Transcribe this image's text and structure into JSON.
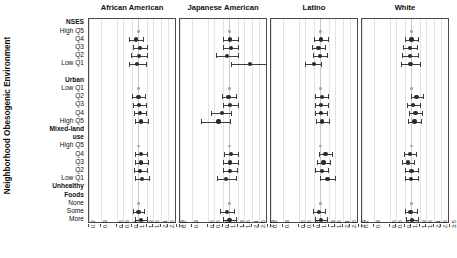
{
  "axis_title": "Neighborhood Obesogenic Environment",
  "chart_data": {
    "type": "scatter",
    "title": "",
    "xlabel": "",
    "ylabel": "Neighborhood Obesogenic Environment",
    "scale": "log",
    "xlim": [
      0.2,
      3.5
    ],
    "grid": true,
    "reference_value": 1.0,
    "legend_position": "none",
    "xticks": [
      "0.2",
      "0.3",
      "0.5",
      "0.6",
      "0.8",
      "1.0",
      "1.3",
      "1.6",
      "2.1",
      "2.6",
      "3.5"
    ],
    "xtick_values": [
      0.2,
      0.3,
      0.5,
      0.6,
      0.8,
      1.0,
      1.3,
      1.6,
      2.1,
      2.6,
      3.5
    ],
    "row_labels": [
      {
        "label": "NSES",
        "bold": true,
        "header": true
      },
      {
        "label": "High Q5",
        "bold": false,
        "header": false
      },
      {
        "label": "Q4",
        "bold": false,
        "header": false
      },
      {
        "label": "Q3",
        "bold": false,
        "header": false
      },
      {
        "label": "Q2",
        "bold": false,
        "header": false
      },
      {
        "label": "Low Q1",
        "bold": false,
        "header": false
      },
      {
        "label": "",
        "bold": false,
        "header": false
      },
      {
        "label": "Urban",
        "bold": true,
        "header": true
      },
      {
        "label": "Low Q1",
        "bold": false,
        "header": false
      },
      {
        "label": "Q2",
        "bold": false,
        "header": false
      },
      {
        "label": "Q3",
        "bold": false,
        "header": false
      },
      {
        "label": "Q4",
        "bold": false,
        "header": false
      },
      {
        "label": "High Q5",
        "bold": false,
        "header": false
      },
      {
        "label": "Mixed-land",
        "bold": true,
        "header": true
      },
      {
        "label": "use",
        "bold": true,
        "header": true
      },
      {
        "label": "High Q5",
        "bold": false,
        "header": false
      },
      {
        "label": "Q4",
        "bold": false,
        "header": false
      },
      {
        "label": "Q3",
        "bold": false,
        "header": false
      },
      {
        "label": "Q2",
        "bold": false,
        "header": false
      },
      {
        "label": "Low Q1",
        "bold": false,
        "header": false
      },
      {
        "label": "Unhealthy",
        "bold": true,
        "header": true
      },
      {
        "label": "Foods",
        "bold": true,
        "header": true
      },
      {
        "label": "None",
        "bold": false,
        "header": false
      },
      {
        "label": "Some",
        "bold": false,
        "header": false
      },
      {
        "label": "More",
        "bold": false,
        "header": false
      }
    ],
    "panels": [
      {
        "name": "African American",
        "points": [
          {
            "row": 1,
            "est": 1.0,
            "lo": 1.0,
            "hi": 1.0,
            "ref": true
          },
          {
            "row": 2,
            "est": 0.93,
            "lo": 0.74,
            "hi": 1.17,
            "ref": false
          },
          {
            "row": 3,
            "est": 1.06,
            "lo": 0.84,
            "hi": 1.33,
            "ref": false
          },
          {
            "row": 4,
            "est": 1.02,
            "lo": 0.79,
            "hi": 1.31,
            "ref": false
          },
          {
            "row": 5,
            "est": 0.96,
            "lo": 0.73,
            "hi": 1.26,
            "ref": false
          },
          {
            "row": 8,
            "est": 1.0,
            "lo": 1.0,
            "hi": 1.0,
            "ref": true
          },
          {
            "row": 9,
            "est": 1.0,
            "lo": 0.82,
            "hi": 1.22,
            "ref": false
          },
          {
            "row": 10,
            "est": 1.03,
            "lo": 0.84,
            "hi": 1.26,
            "ref": false
          },
          {
            "row": 11,
            "est": 1.05,
            "lo": 0.86,
            "hi": 1.29,
            "ref": false
          },
          {
            "row": 12,
            "est": 1.09,
            "lo": 0.88,
            "hi": 1.35,
            "ref": false
          },
          {
            "row": 15,
            "est": 1.0,
            "lo": 1.0,
            "hi": 1.0,
            "ref": true
          },
          {
            "row": 16,
            "est": 1.08,
            "lo": 0.88,
            "hi": 1.33,
            "ref": false
          },
          {
            "row": 17,
            "est": 1.09,
            "lo": 0.88,
            "hi": 1.35,
            "ref": false
          },
          {
            "row": 18,
            "est": 1.06,
            "lo": 0.87,
            "hi": 1.3,
            "ref": false
          },
          {
            "row": 19,
            "est": 1.12,
            "lo": 0.9,
            "hi": 1.39,
            "ref": false
          },
          {
            "row": 22,
            "est": 1.0,
            "lo": 1.0,
            "hi": 1.0,
            "ref": true
          },
          {
            "row": 23,
            "est": 1.0,
            "lo": 0.83,
            "hi": 1.21,
            "ref": false
          },
          {
            "row": 24,
            "est": 1.08,
            "lo": 0.88,
            "hi": 1.32,
            "ref": false
          }
        ]
      },
      {
        "name": "Japanese American",
        "points": [
          {
            "row": 1,
            "est": 1.0,
            "lo": 1.0,
            "hi": 1.0,
            "ref": true
          },
          {
            "row": 2,
            "est": 1.02,
            "lo": 0.8,
            "hi": 1.3,
            "ref": false
          },
          {
            "row": 3,
            "est": 1.04,
            "lo": 0.82,
            "hi": 1.33,
            "ref": false
          },
          {
            "row": 4,
            "est": 0.92,
            "lo": 0.65,
            "hi": 1.3,
            "ref": false
          },
          {
            "row": 5,
            "est": 1.95,
            "lo": 1.05,
            "hi": 3.5,
            "ref": false
          },
          {
            "row": 8,
            "est": 1.0,
            "lo": 1.0,
            "hi": 1.0,
            "ref": true
          },
          {
            "row": 9,
            "est": 0.97,
            "lo": 0.78,
            "hi": 1.22,
            "ref": false
          },
          {
            "row": 10,
            "est": 1.03,
            "lo": 0.82,
            "hi": 1.3,
            "ref": false
          },
          {
            "row": 11,
            "est": 0.78,
            "lo": 0.55,
            "hi": 1.06,
            "ref": false
          },
          {
            "row": 12,
            "est": 0.7,
            "lo": 0.4,
            "hi": 1.02,
            "ref": false
          },
          {
            "row": 15,
            "est": 1.0,
            "lo": 1.0,
            "hi": 1.0,
            "ref": true
          },
          {
            "row": 16,
            "est": 1.05,
            "lo": 0.85,
            "hi": 1.3,
            "ref": false
          },
          {
            "row": 17,
            "est": 1.03,
            "lo": 0.82,
            "hi": 1.3,
            "ref": false
          },
          {
            "row": 18,
            "est": 1.02,
            "lo": 0.8,
            "hi": 1.28,
            "ref": false
          },
          {
            "row": 19,
            "est": 0.9,
            "lo": 0.66,
            "hi": 1.22,
            "ref": false
          },
          {
            "row": 22,
            "est": 1.0,
            "lo": 1.0,
            "hi": 1.0,
            "ref": true
          },
          {
            "row": 23,
            "est": 0.92,
            "lo": 0.73,
            "hi": 1.14,
            "ref": false
          },
          {
            "row": 24,
            "est": 1.0,
            "lo": 0.8,
            "hi": 1.25,
            "ref": false
          }
        ]
      },
      {
        "name": "Latino",
        "points": [
          {
            "row": 1,
            "est": 1.0,
            "lo": 1.0,
            "hi": 1.0,
            "ref": true
          },
          {
            "row": 2,
            "est": 1.02,
            "lo": 0.82,
            "hi": 1.27,
            "ref": false
          },
          {
            "row": 3,
            "est": 0.94,
            "lo": 0.76,
            "hi": 1.17,
            "ref": false
          },
          {
            "row": 4,
            "est": 0.98,
            "lo": 0.79,
            "hi": 1.22,
            "ref": false
          },
          {
            "row": 5,
            "est": 0.8,
            "lo": 0.6,
            "hi": 1.03,
            "ref": false
          },
          {
            "row": 8,
            "est": 1.0,
            "lo": 1.0,
            "hi": 1.0,
            "ref": true
          },
          {
            "row": 9,
            "est": 1.04,
            "lo": 0.85,
            "hi": 1.27,
            "ref": false
          },
          {
            "row": 10,
            "est": 1.03,
            "lo": 0.84,
            "hi": 1.26,
            "ref": false
          },
          {
            "row": 11,
            "est": 1.02,
            "lo": 0.84,
            "hi": 1.25,
            "ref": false
          },
          {
            "row": 12,
            "est": 1.06,
            "lo": 0.86,
            "hi": 1.3,
            "ref": false
          },
          {
            "row": 15,
            "est": 1.0,
            "lo": 1.0,
            "hi": 1.0,
            "ref": true
          },
          {
            "row": 16,
            "est": 1.18,
            "lo": 0.96,
            "hi": 1.45,
            "ref": false
          },
          {
            "row": 17,
            "est": 1.1,
            "lo": 0.9,
            "hi": 1.36,
            "ref": false
          },
          {
            "row": 18,
            "est": 1.04,
            "lo": 0.85,
            "hi": 1.28,
            "ref": false
          },
          {
            "row": 19,
            "est": 1.26,
            "lo": 1.0,
            "hi": 1.58,
            "ref": false
          },
          {
            "row": 22,
            "est": 1.0,
            "lo": 1.0,
            "hi": 1.0,
            "ref": true
          },
          {
            "row": 23,
            "est": 0.96,
            "lo": 0.79,
            "hi": 1.17,
            "ref": false
          },
          {
            "row": 24,
            "est": 1.01,
            "lo": 0.83,
            "hi": 1.24,
            "ref": false
          }
        ]
      },
      {
        "name": "White",
        "points": [
          {
            "row": 1,
            "est": 1.0,
            "lo": 1.0,
            "hi": 1.0,
            "ref": true
          },
          {
            "row": 2,
            "est": 1.0,
            "lo": 0.82,
            "hi": 1.22,
            "ref": false
          },
          {
            "row": 3,
            "est": 0.95,
            "lo": 0.75,
            "hi": 1.2,
            "ref": false
          },
          {
            "row": 4,
            "est": 0.95,
            "lo": 0.73,
            "hi": 1.24,
            "ref": false
          },
          {
            "row": 5,
            "est": 0.97,
            "lo": 0.72,
            "hi": 1.3,
            "ref": false
          },
          {
            "row": 8,
            "est": 1.0,
            "lo": 1.0,
            "hi": 1.0,
            "ref": true
          },
          {
            "row": 9,
            "est": 1.18,
            "lo": 0.97,
            "hi": 1.44,
            "ref": false
          },
          {
            "row": 10,
            "est": 1.06,
            "lo": 0.87,
            "hi": 1.3,
            "ref": false
          },
          {
            "row": 11,
            "est": 1.14,
            "lo": 0.93,
            "hi": 1.4,
            "ref": false
          },
          {
            "row": 12,
            "est": 1.1,
            "lo": 0.9,
            "hi": 1.36,
            "ref": false
          },
          {
            "row": 15,
            "est": 1.0,
            "lo": 1.0,
            "hi": 1.0,
            "ref": true
          },
          {
            "row": 16,
            "est": 0.95,
            "lo": 0.78,
            "hi": 1.16,
            "ref": false
          },
          {
            "row": 17,
            "est": 0.9,
            "lo": 0.74,
            "hi": 1.1,
            "ref": false
          },
          {
            "row": 18,
            "est": 1.0,
            "lo": 0.82,
            "hi": 1.22,
            "ref": false
          },
          {
            "row": 19,
            "est": 0.99,
            "lo": 0.8,
            "hi": 1.22,
            "ref": false
          },
          {
            "row": 22,
            "est": 1.0,
            "lo": 1.0,
            "hi": 1.0,
            "ref": true
          },
          {
            "row": 23,
            "est": 0.97,
            "lo": 0.8,
            "hi": 1.18,
            "ref": false
          },
          {
            "row": 24,
            "est": 1.03,
            "lo": 0.85,
            "hi": 1.25,
            "ref": false
          }
        ]
      }
    ]
  }
}
